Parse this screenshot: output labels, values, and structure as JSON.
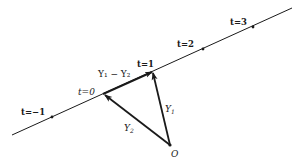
{
  "diagram": {
    "type": "vector-line-parametrization",
    "line_points": [
      {
        "t": "-1",
        "label": "t=−1"
      },
      {
        "t": "0",
        "label": "t=0"
      },
      {
        "t": "1",
        "label": "t=1"
      },
      {
        "t": "2",
        "label": "t=2"
      },
      {
        "t": "3",
        "label": "t=3"
      }
    ],
    "vectors": [
      {
        "name": "Y1",
        "label_main": "Y",
        "label_sub": "1",
        "from": "O",
        "to": "t=1"
      },
      {
        "name": "Y2",
        "label_main": "Y",
        "label_sub": "2",
        "from": "O",
        "to": "t=0"
      },
      {
        "name": "Y1-Y2",
        "label": "Y₁ − Y₂",
        "from": "t=0",
        "to": "t=1"
      }
    ],
    "origin_label": "O",
    "colors": {
      "ink": "#1a1a1a",
      "background": "#ffffff"
    }
  }
}
